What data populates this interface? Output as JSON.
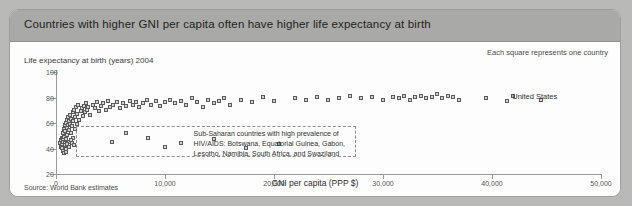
{
  "header": {
    "title": "Countries with higher GNI per capita often have higher life expectancy at birth"
  },
  "panel": {
    "y_axis_title": "Life expectancy at birth (years) 2004",
    "legend_note": "Each square represents one country",
    "source": "Source: World Bank estimates"
  },
  "annotations": {
    "hiv_box_lines": [
      "Sub-Saharan countries with high prevalence of",
      "HIV/AIDS: Botswana, Equatorial Guinea, Gabon,",
      "Lesotho, Namibia, South Africa, and Swaziland"
    ],
    "united_states_label": "United States"
  },
  "colors": {
    "page_background": "#b9b9b7",
    "header_bar": "#a9a9a7",
    "panel_background": "#fdfdfd",
    "marker_fill": "#d3d3d3",
    "marker_stroke": "#5a5a5a",
    "axis": "#9a9a9a",
    "dashed_box": "#8d8d8d"
  },
  "chart_data": {
    "type": "scatter",
    "title": "Countries with higher GNI per capita often have higher life expectancy at birth",
    "subtitle": "Each square represents one country",
    "xlabel": "GNI per capita (PPP $)",
    "ylabel": "Life expectancy at birth (years) 2004",
    "source": "Source: World Bank estimates",
    "xlim": [
      0,
      50000
    ],
    "ylim": [
      20,
      100
    ],
    "xticks": [
      0,
      10000,
      20000,
      30000,
      40000,
      50000
    ],
    "xticklabels": [
      "0",
      "10,000",
      "20,000",
      "30,000",
      "40,000",
      "50,000"
    ],
    "yticks": [
      20,
      40,
      60,
      80,
      100
    ],
    "yticklabels": [
      "20",
      "40",
      "60",
      "80",
      "100"
    ],
    "grid": false,
    "legend": null,
    "points": [
      [
        420,
        44
      ],
      [
        480,
        41
      ],
      [
        520,
        46
      ],
      [
        560,
        43
      ],
      [
        600,
        48
      ],
      [
        640,
        40
      ],
      [
        680,
        45
      ],
      [
        700,
        52
      ],
      [
        720,
        47
      ],
      [
        760,
        55
      ],
      [
        800,
        49
      ],
      [
        830,
        58
      ],
      [
        860,
        44
      ],
      [
        900,
        53
      ],
      [
        940,
        60
      ],
      [
        980,
        47
      ],
      [
        1010,
        56
      ],
      [
        1050,
        62
      ],
      [
        1090,
        50
      ],
      [
        1120,
        58
      ],
      [
        1160,
        64
      ],
      [
        1200,
        54
      ],
      [
        1240,
        61
      ],
      [
        1280,
        45
      ],
      [
        1320,
        59
      ],
      [
        1360,
        66
      ],
      [
        1400,
        52
      ],
      [
        1450,
        63
      ],
      [
        1500,
        57
      ],
      [
        1560,
        68
      ],
      [
        1600,
        48
      ],
      [
        1650,
        61
      ],
      [
        1700,
        70
      ],
      [
        1760,
        55
      ],
      [
        1820,
        64
      ],
      [
        1880,
        72
      ],
      [
        1950,
        59
      ],
      [
        2000,
        67
      ],
      [
        2100,
        74
      ],
      [
        2200,
        62
      ],
      [
        2300,
        69
      ],
      [
        2400,
        71
      ],
      [
        2500,
        65
      ],
      [
        2600,
        73
      ],
      [
        2700,
        68
      ],
      [
        2800,
        75
      ],
      [
        2900,
        70
      ],
      [
        3000,
        72
      ],
      [
        3200,
        66
      ],
      [
        3400,
        74
      ],
      [
        3600,
        71
      ],
      [
        3800,
        76
      ],
      [
        4000,
        69
      ],
      [
        4200,
        73
      ],
      [
        4400,
        75
      ],
      [
        4600,
        70
      ],
      [
        4800,
        77
      ],
      [
        5000,
        72
      ],
      [
        5300,
        74
      ],
      [
        5600,
        76
      ],
      [
        5900,
        71
      ],
      [
        6200,
        75
      ],
      [
        6500,
        73
      ],
      [
        6800,
        77
      ],
      [
        7100,
        74
      ],
      [
        7400,
        76
      ],
      [
        7700,
        72
      ],
      [
        8000,
        75
      ],
      [
        8400,
        78
      ],
      [
        8800,
        74
      ],
      [
        9200,
        77
      ],
      [
        9600,
        73
      ],
      [
        10000,
        76
      ],
      [
        10500,
        78
      ],
      [
        11000,
        75
      ],
      [
        11500,
        77
      ],
      [
        12000,
        74
      ],
      [
        12500,
        79
      ],
      [
        13000,
        76
      ],
      [
        13500,
        72
      ],
      [
        14000,
        78
      ],
      [
        14500,
        75
      ],
      [
        15000,
        77
      ],
      [
        15500,
        79
      ],
      [
        16000,
        74
      ],
      [
        17000,
        78
      ],
      [
        18000,
        76
      ],
      [
        19000,
        80
      ],
      [
        20000,
        77
      ],
      [
        22000,
        79
      ],
      [
        23000,
        78
      ],
      [
        24000,
        80
      ],
      [
        25000,
        78
      ],
      [
        26000,
        79
      ],
      [
        27000,
        81
      ],
      [
        28000,
        79
      ],
      [
        29000,
        80
      ],
      [
        30000,
        78
      ],
      [
        31000,
        80
      ],
      [
        31500,
        79
      ],
      [
        32000,
        81
      ],
      [
        32500,
        78
      ],
      [
        33000,
        80
      ],
      [
        33500,
        81
      ],
      [
        34000,
        79
      ],
      [
        34500,
        80
      ],
      [
        35000,
        82
      ],
      [
        35500,
        79
      ],
      [
        36000,
        81
      ],
      [
        36500,
        80
      ],
      [
        37000,
        78
      ],
      [
        39500,
        79
      ],
      [
        42000,
        81
      ],
      [
        44500,
        78
      ],
      [
        8500,
        48
      ],
      [
        11500,
        44
      ],
      [
        14500,
        47
      ],
      [
        10000,
        41
      ],
      [
        6500,
        52
      ],
      [
        5200,
        45
      ],
      [
        17500,
        40
      ],
      [
        20500,
        43
      ],
      [
        700,
        38
      ],
      [
        760,
        36
      ],
      [
        840,
        42
      ],
      [
        920,
        39
      ],
      [
        1000,
        37
      ],
      [
        1100,
        43
      ],
      [
        1250,
        41
      ],
      [
        1400,
        46
      ],
      [
        1550,
        44
      ],
      [
        1700,
        42
      ]
    ],
    "highlight_points": [
      {
        "label": "United States",
        "x": 41400,
        "y": 77
      }
    ],
    "annotation_region": {
      "label": "Sub-Saharan countries with high prevalence of HIV/AIDS: Botswana, Equatorial Guinea, Gabon, Lesotho, Namibia, South Africa, and Swaziland",
      "x_range": [
        1800,
        27500
      ],
      "y_range": [
        33,
        58
      ]
    }
  }
}
